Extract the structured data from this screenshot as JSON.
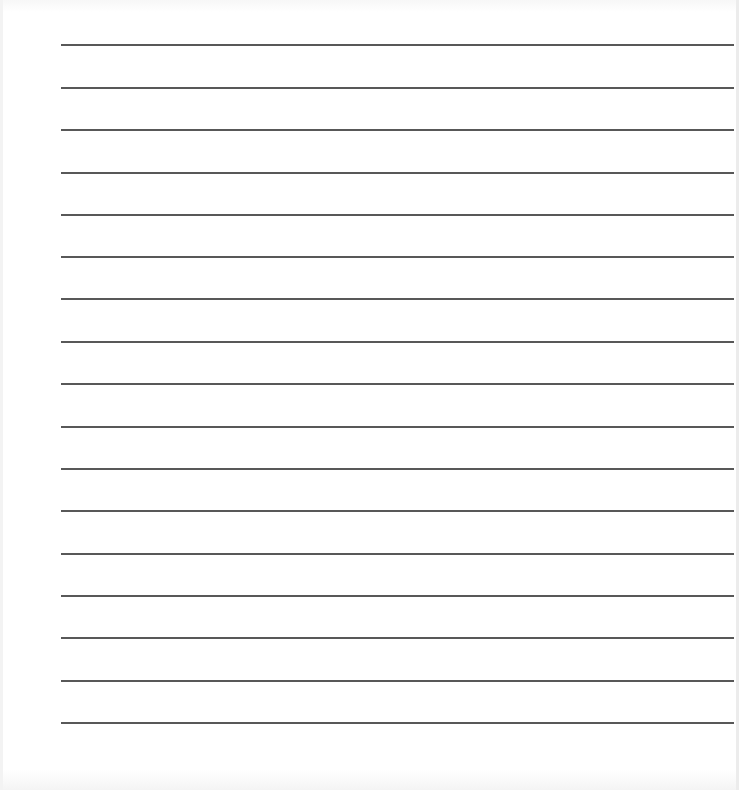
{
  "document": {
    "type": "ruled-writing-page",
    "line_count": 17,
    "line_color": "#4a4a4a",
    "background": "#ffffff",
    "lines": [
      {
        "y": 44
      },
      {
        "y": 87
      },
      {
        "y": 129
      },
      {
        "y": 172
      },
      {
        "y": 214
      },
      {
        "y": 256
      },
      {
        "y": 298
      },
      {
        "y": 341
      },
      {
        "y": 383
      },
      {
        "y": 426
      },
      {
        "y": 468
      },
      {
        "y": 510
      },
      {
        "y": 553
      },
      {
        "y": 595
      },
      {
        "y": 637
      },
      {
        "y": 680
      },
      {
        "y": 722
      }
    ]
  }
}
